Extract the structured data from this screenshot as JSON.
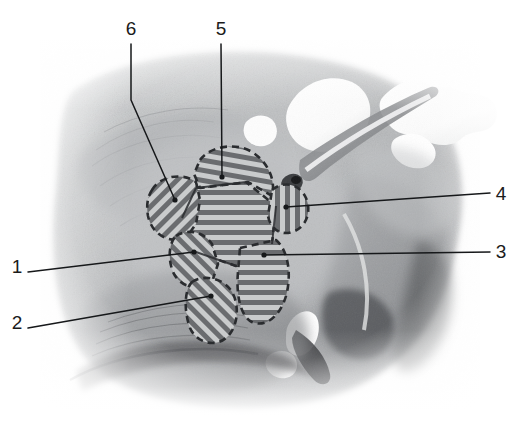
{
  "figure": {
    "type": "anatomical-illustration",
    "style": "grayscale pencil / airbrush rendering with dashed-outline hatched overlay regions",
    "width": 518,
    "height": 424,
    "background_color": "#ffffff",
    "ink_color": "#16181a",
    "hatch_color": "#6d6f72",
    "hatch_dark_color": "#3c3e41",
    "tissue_mid_color": "#b9bbbd",
    "tissue_light_color": "#d8dadb",
    "tissue_dark_color": "#7d7f82",
    "bone_color": "#ffffff"
  },
  "overlay": {
    "name": "hatched-lobed-region",
    "description": "star/flower shaped multi-lobed region with dashed border and parallel line hatching",
    "lobes": [
      {
        "id": "lobe-6",
        "label": "6",
        "hatch_angle_deg": 45,
        "note": "left lobe, hatching lower-left to upper-right"
      },
      {
        "id": "lobe-5",
        "label": "5",
        "hatch_angle_deg": 10,
        "note": "upper lobe, near-horizontal hatching"
      },
      {
        "id": "lobe-4",
        "label": "4",
        "hatch_angle_deg": 90,
        "note": "right lobe, vertical hatching"
      },
      {
        "id": "lobe-3",
        "label": "3",
        "hatch_angle_deg": 0,
        "note": "lower-right lobe, horizontal hatching"
      },
      {
        "id": "lobe-1",
        "label": "1",
        "hatch_angle_deg": 135,
        "note": "lower-left lobe, hatching upper-left to lower-right"
      },
      {
        "id": "lobe-2",
        "label": "2",
        "hatch_angle_deg": 135,
        "note": "bottom lobe, chevron hatching"
      },
      {
        "id": "lobe-center",
        "label": "",
        "hatch_angle_deg": 0,
        "note": "central body, horizontal hatching"
      }
    ]
  },
  "callouts": [
    {
      "id": "callout-6",
      "label": "6",
      "label_x": 131,
      "label_y": 30,
      "target_x": 175,
      "target_y": 200,
      "side": "top"
    },
    {
      "id": "callout-5",
      "label": "5",
      "label_x": 221,
      "label_y": 30,
      "target_x": 222,
      "target_y": 177,
      "side": "top"
    },
    {
      "id": "callout-4",
      "label": "4",
      "label_x": 501,
      "label_y": 195,
      "target_x": 286,
      "target_y": 207,
      "side": "right"
    },
    {
      "id": "callout-3",
      "label": "3",
      "label_x": 501,
      "label_y": 253,
      "target_x": 264,
      "target_y": 255,
      "side": "right"
    },
    {
      "id": "callout-1",
      "label": "1",
      "label_x": 17,
      "label_y": 268,
      "target_x": 194,
      "target_y": 252,
      "side": "left"
    },
    {
      "id": "callout-2",
      "label": "2",
      "label_x": 17,
      "label_y": 324,
      "target_x": 211,
      "target_y": 296,
      "side": "left"
    }
  ]
}
